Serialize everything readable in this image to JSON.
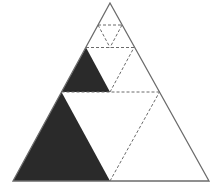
{
  "diagram": {
    "colors": {
      "outline": "#6b6b6b",
      "fill": "#2a2a2a",
      "dashed": "#6b6b6b",
      "background": "#ffffff"
    },
    "outer_triangle": [
      [
        110,
        3
      ],
      [
        13,
        181
      ],
      [
        209,
        181
      ]
    ],
    "filled_triangles": [
      [
        [
          13,
          181
        ],
        [
          61.5,
          92
        ],
        [
          110,
          181
        ]
      ],
      [
        [
          61.5,
          92
        ],
        [
          86,
          47.5
        ],
        [
          110,
          92
        ]
      ]
    ],
    "dashed_lines": [
      [
        [
          61.5,
          92
        ],
        [
          159.5,
          92
        ]
      ],
      [
        [
          110,
          181
        ],
        [
          159.5,
          92
        ]
      ],
      [
        [
          86,
          47.5
        ],
        [
          134,
          47.5
        ]
      ],
      [
        [
          110,
          92
        ],
        [
          134,
          47.5
        ]
      ],
      [
        [
          98,
          25
        ],
        [
          122,
          25
        ]
      ],
      [
        [
          98,
          25
        ],
        [
          110,
          47.5
        ]
      ],
      [
        [
          122,
          25
        ],
        [
          110,
          47.5
        ]
      ]
    ]
  }
}
